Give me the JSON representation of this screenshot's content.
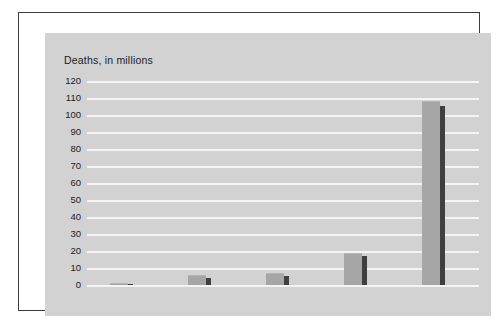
{
  "chart_data": {
    "type": "bar",
    "title": "Deaths, in millions",
    "xlabel": "",
    "ylabel": "Deaths, in millions",
    "categories": [
      "1500s",
      "1600s",
      "1700s",
      "1800s",
      "1900s"
    ],
    "series": [
      {
        "name": "deaths",
        "values": [
          1,
          6,
          7,
          19,
          108
        ],
        "color": "#a6a6a6"
      },
      {
        "name": "deaths-shadow",
        "values": [
          0.5,
          4,
          5,
          17,
          105
        ],
        "color": "#3f3f3f"
      }
    ],
    "ylim": [
      0,
      120
    ],
    "ytick_labels": [
      "120",
      "110",
      "100",
      "90",
      "80",
      "70",
      "60",
      "50",
      "40",
      "30",
      "20",
      "10",
      "0"
    ],
    "ytick_values": [
      120,
      110,
      100,
      90,
      80,
      70,
      60,
      50,
      40,
      30,
      20,
      10,
      0
    ],
    "ytick_step": 10,
    "grid": true,
    "grid_color": "#f4f4f4",
    "legend": null,
    "legend_position": "none",
    "annotations": [],
    "plot_background": "#d2d2d2",
    "page_background": "#ffffff",
    "frame_color": "#3c3c3c"
  }
}
